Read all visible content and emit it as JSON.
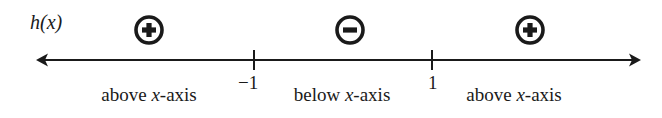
{
  "diagram": {
    "type": "sign-chart",
    "function_label": "h(x)",
    "function_name": "h",
    "function_var": "x",
    "axis": {
      "color": "#1a1a1a",
      "left_arrow": true,
      "right_arrow": true
    },
    "critical_points": [
      {
        "value": "−1",
        "x": -1
      },
      {
        "value": "1",
        "x": 1
      }
    ],
    "intervals": [
      {
        "range": "x < -1",
        "sign": "+",
        "sign_icon": "plus-circle-icon",
        "description_pre": "above ",
        "description_var": "x",
        "description_post": "-axis"
      },
      {
        "range": "-1 < x < 1",
        "sign": "−",
        "sign_icon": "minus-circle-icon",
        "description_pre": "below ",
        "description_var": "x",
        "description_post": "-axis"
      },
      {
        "range": "x > 1",
        "sign": "+",
        "sign_icon": "plus-circle-icon",
        "description_pre": "above ",
        "description_var": "x",
        "description_post": "-axis"
      }
    ]
  }
}
